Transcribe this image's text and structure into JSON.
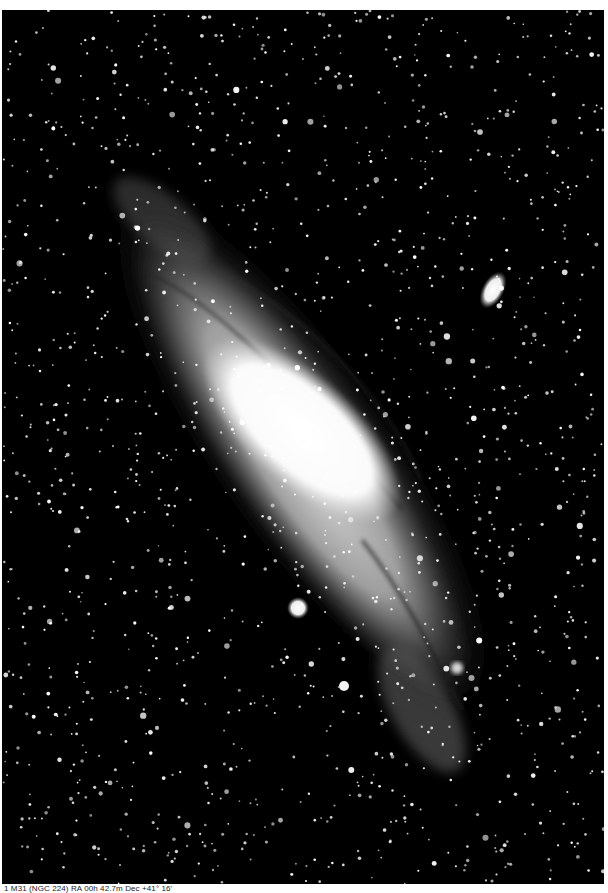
{
  "figure": {
    "colors": {
      "background": "#000000",
      "core": "#ffffff",
      "disk": "#bdbdbd",
      "page": "#ffffff"
    },
    "objects": [
      {
        "name": "M31 core",
        "x": 300,
        "y": 410
      },
      {
        "name": "M110 (satellite galaxy)",
        "x": 493,
        "y": 290
      },
      {
        "name": "M32 (satellite galaxy)",
        "x": 298,
        "y": 608
      }
    ]
  },
  "caption": {
    "text": "1  M31 (NGC 224) RA 00h 42.7m  Dec +41° 16'"
  }
}
